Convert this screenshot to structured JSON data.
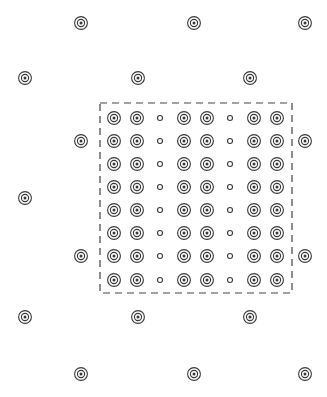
{
  "figure": {
    "canvas": {
      "width": 327,
      "height": 397,
      "background": "#ffffff"
    },
    "style": {
      "stroke_color": "#3a3a3a",
      "stroke_width": 1.1,
      "fill_color": "none",
      "dash_color": "#444444",
      "dash_pattern": "7 5",
      "dash_width": 1.2
    },
    "markers": {
      "concentric": {
        "name": "concentric-circle-marker",
        "outer_radius": 6.4,
        "middle_radius": 3.6,
        "center_dot_radius": 1.5,
        "ring_count": 2,
        "has_center_dot": true
      },
      "small": {
        "name": "small-circle-marker",
        "radius": 2.5,
        "ring_count": 1,
        "has_center_dot": false
      }
    },
    "dashed_box": {
      "label": "unit-cell-boundary",
      "x": 100,
      "y": 103,
      "width": 192,
      "height": 190
    },
    "outer_lattice": {
      "label": "outer-sparse-lattice",
      "marker_type": "concentric",
      "rows": [
        {
          "y": 23,
          "x": [
            81,
            194,
            305
          ]
        },
        {
          "y": 78,
          "x": [
            25,
            138,
            250
          ]
        },
        {
          "y": 141,
          "x": [
            81,
            305
          ]
        },
        {
          "y": 198,
          "x": [
            25
          ]
        },
        {
          "y": 256,
          "x": [
            81,
            305
          ]
        },
        {
          "y": 317,
          "x": [
            25,
            138,
            250
          ]
        },
        {
          "y": 374,
          "x": [
            81,
            194,
            305
          ]
        }
      ],
      "point_count": 17
    },
    "inner_lattice": {
      "label": "inner-dense-grid",
      "columns": 8,
      "rows": 8,
      "column_x": [
        114,
        137,
        160,
        184,
        207,
        230,
        254,
        277
      ],
      "row_y": [
        118,
        141,
        164,
        187,
        210,
        233,
        256,
        280
      ],
      "small_marker_columns": [
        3,
        6
      ],
      "concentric_marker_columns": [
        1,
        2,
        4,
        5,
        7,
        8
      ],
      "point_count": 64
    }
  },
  "chart_data": {
    "type": "scatter",
    "xlabel": "",
    "ylabel": "",
    "xlim": [
      0,
      327
    ],
    "ylim": [
      0,
      397
    ],
    "grid": false,
    "legend": "none",
    "series": [
      {
        "name": "outer-lattice-points",
        "marker": "concentric-circle",
        "x": [
          81,
          194,
          305,
          25,
          138,
          250,
          81,
          305,
          25,
          81,
          305,
          25,
          138,
          250,
          81,
          194,
          305
        ],
        "y": [
          23,
          23,
          23,
          78,
          78,
          78,
          141,
          141,
          198,
          256,
          256,
          317,
          317,
          317,
          374,
          374,
          374
        ]
      },
      {
        "name": "inner-lattice-concentric-points",
        "marker": "concentric-circle",
        "x": [
          114,
          137,
          184,
          207,
          254,
          277,
          114,
          137,
          184,
          207,
          254,
          277,
          114,
          137,
          184,
          207,
          254,
          277,
          114,
          137,
          184,
          207,
          254,
          277,
          114,
          137,
          184,
          207,
          254,
          277,
          114,
          137,
          184,
          207,
          254,
          277,
          114,
          137,
          184,
          207,
          254,
          277,
          114,
          137,
          184,
          207,
          254,
          277
        ],
        "y": [
          118,
          118,
          118,
          118,
          118,
          118,
          141,
          141,
          141,
          141,
          141,
          141,
          164,
          164,
          164,
          164,
          164,
          164,
          187,
          187,
          187,
          187,
          187,
          187,
          210,
          210,
          210,
          210,
          210,
          210,
          233,
          233,
          233,
          233,
          233,
          233,
          256,
          256,
          256,
          256,
          256,
          256,
          280,
          280,
          280,
          280,
          280,
          280
        ]
      },
      {
        "name": "inner-lattice-small-points",
        "marker": "small-circle",
        "x": [
          160,
          230,
          160,
          230,
          160,
          230,
          160,
          230,
          160,
          230,
          160,
          230,
          160,
          230,
          160,
          230
        ],
        "y": [
          118,
          118,
          141,
          141,
          164,
          164,
          187,
          187,
          210,
          210,
          233,
          233,
          256,
          256,
          280,
          280
        ]
      }
    ],
    "annotations": [
      {
        "name": "dashed-rectangle",
        "type": "rect",
        "x": 100,
        "y": 103,
        "width": 192,
        "height": 190,
        "linestyle": "dashed"
      }
    ]
  }
}
